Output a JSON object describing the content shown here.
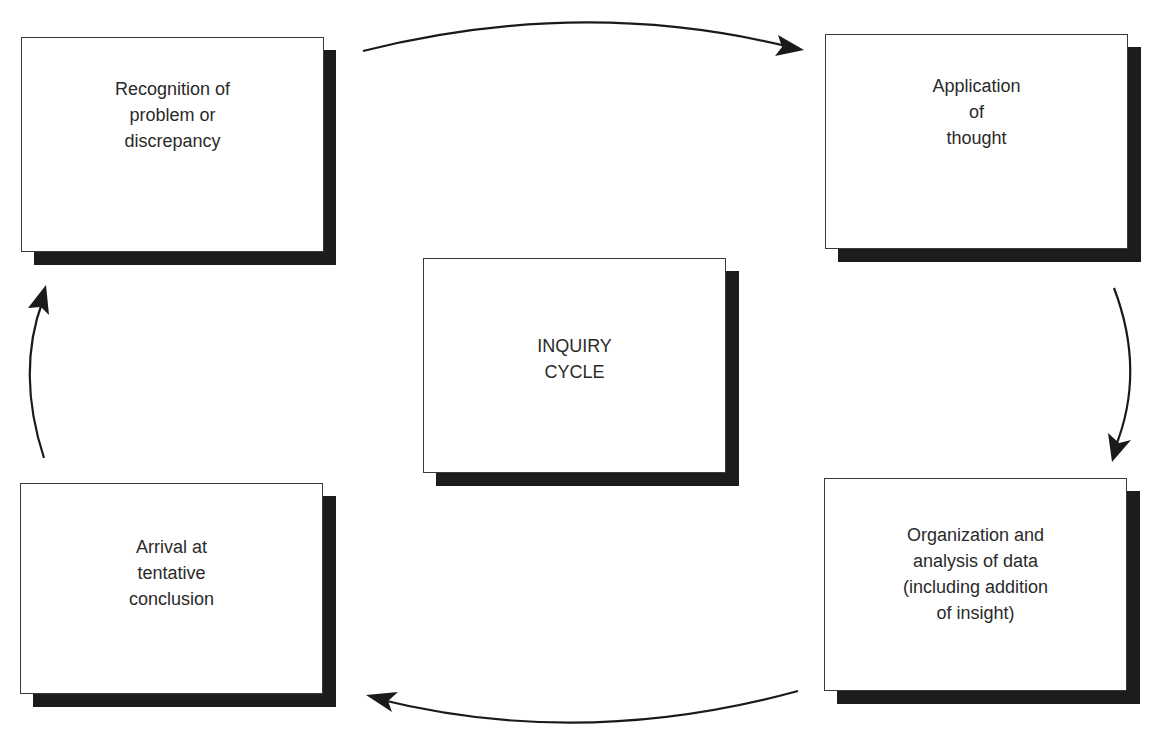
{
  "diagram": {
    "title": "INQUIRY CYCLE",
    "center": {
      "label": "INQUIRY\nCYCLE"
    },
    "steps": [
      {
        "id": "recognition",
        "label": "Recognition of\nproblem or\ndiscrepancy"
      },
      {
        "id": "application",
        "label": "Application\nof\nthought"
      },
      {
        "id": "organization",
        "label": "Organization and\nanalysis of data\n(including addition\nof insight)"
      },
      {
        "id": "conclusion",
        "label": "Arrival at\ntentative\nconclusion"
      }
    ],
    "flow": [
      {
        "from": "recognition",
        "to": "application"
      },
      {
        "from": "application",
        "to": "organization"
      },
      {
        "from": "organization",
        "to": "conclusion"
      },
      {
        "from": "conclusion",
        "to": "recognition"
      }
    ],
    "colors": {
      "box_border": "#3a3a3a",
      "shadow": "#1c1c1c",
      "text": "#2a2a2a",
      "arrow": "#1a1a1a"
    }
  }
}
